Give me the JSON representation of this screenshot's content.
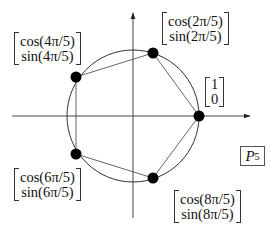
{
  "diagram": {
    "title": "P5",
    "label_box": {
      "letter": "P",
      "subscript": "5"
    },
    "colors": {
      "stroke": "#333333",
      "points": "#000000",
      "background": "#ffffff"
    },
    "axes": {
      "x": {
        "from": [
          12,
          116
        ],
        "to": [
          250,
          116
        ],
        "arrow": "right"
      },
      "y": {
        "from": [
          133,
          218
        ],
        "to": [
          133,
          13
        ],
        "arrow": "up"
      }
    },
    "circle": {
      "cx": 133,
      "cy": 116,
      "r": 66
    },
    "points": [
      {
        "id": "p0",
        "angle": "0",
        "x": 199,
        "y": 116,
        "label_top": "1",
        "label_bottom": "0"
      },
      {
        "id": "p1",
        "angle": "2π/5",
        "x": 153,
        "y": 53,
        "label_top": "cos(2π/5)",
        "label_bottom": "sin(2π/5)"
      },
      {
        "id": "p2",
        "angle": "4π/5",
        "x": 76,
        "y": 77,
        "label_top": "cos(4π/5)",
        "label_bottom": "sin(4π/5)"
      },
      {
        "id": "p3",
        "angle": "6π/5",
        "x": 76,
        "y": 154,
        "label_top": "cos(6π/5)",
        "label_bottom": "sin(6π/5)"
      },
      {
        "id": "p4",
        "angle": "8π/5",
        "x": 153,
        "y": 178,
        "label_top": "cos(8π/5)",
        "label_bottom": "sin(8π/5)"
      }
    ],
    "polygon": "pentagon inscribed in unit circle"
  }
}
